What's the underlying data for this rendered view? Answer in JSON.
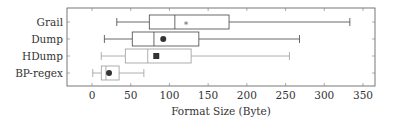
{
  "chart_data": {
    "type": "boxplot",
    "orientation": "horizontal",
    "title": "",
    "xlabel": "Format Size (Byte)",
    "ylabel": "",
    "xlim": [
      -25,
      365
    ],
    "xticks": [
      0,
      50,
      100,
      150,
      200,
      250,
      300,
      350
    ],
    "xtick_labels": [
      "0",
      "50",
      "100",
      "150",
      "200",
      "250",
      "300",
      "350"
    ],
    "grid": "ticks only",
    "legend": null,
    "categories": [
      "Grail",
      "Dump",
      "HDump",
      "BP-regex"
    ],
    "series": [
      {
        "name": "Grail",
        "whisker_low": 32,
        "q1": 74,
        "median": 107,
        "mean": 121,
        "q3": 177,
        "whisker_high": 333,
        "mean_marker": "star",
        "color": "#444444"
      },
      {
        "name": "Dump",
        "whisker_low": 16,
        "q1": 52,
        "median": 80,
        "mean": 92,
        "q3": 138,
        "whisker_high": 268,
        "mean_marker": "circle",
        "color": "#444444"
      },
      {
        "name": "HDump",
        "whisker_low": 12,
        "q1": 43,
        "median": 72,
        "mean": 83,
        "q3": 128,
        "whisker_high": 255,
        "mean_marker": "square",
        "color": "#9a9a9a"
      },
      {
        "name": "BP-regex",
        "whisker_low": 1,
        "q1": 12,
        "median": 18,
        "mean": 22,
        "q3": 35,
        "whisker_high": 67,
        "mean_marker": "circle",
        "color": "#9a9a9a"
      }
    ]
  }
}
